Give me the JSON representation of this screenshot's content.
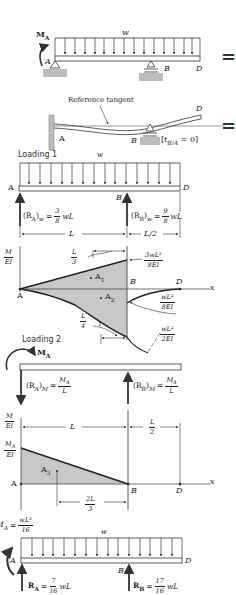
{
  "figure": {
    "panel_1_actual": {
      "moment_label": "M",
      "moment_sub": "A",
      "load_label": "w",
      "point_a": "A",
      "point_b": "B",
      "point_d": "D",
      "equals": "="
    },
    "panel_2_deflected": {
      "tangent_label": "Reference tangent",
      "point_a": "A",
      "point_b": "B",
      "point_d": "D",
      "condition": "[t",
      "condition_sub": "B/A",
      "condition_rhs": " = 0]",
      "equals": "="
    },
    "loading_1": {
      "title": "Loading 1",
      "load_label": "w",
      "point_a": "A",
      "point_b": "B",
      "point_d": "D",
      "reaction_a": {
        "prefix": "(R",
        "sub": "A",
        "suffix": ")",
        "subscript_w": "w",
        "eq": "=",
        "num": "3",
        "den": "8",
        "tail": "wL"
      },
      "reaction_b": {
        "prefix": "(R",
        "sub": "B",
        "suffix": ")",
        "subscript_w": "w",
        "eq": "=",
        "num": "9",
        "den": "8",
        "tail": "wL"
      },
      "dim_span": "L",
      "dim_overhang": "L/2",
      "diagram": {
        "axis_y_num": "M",
        "axis_y_den": "EI",
        "axis_x": "x",
        "point_a": "A",
        "point_b": "B",
        "point_d": "D",
        "area_1": "A",
        "area_1_sub": "1",
        "area_2": "A",
        "area_2_sub": "2",
        "centroid_1_num": "L",
        "centroid_1_den": "3",
        "centroid_2_num": "L",
        "centroid_2_den": "4",
        "peak_1_num": "3wL²",
        "peak_1_den": "8EI",
        "peak_2_num": "wL²",
        "peak_2_den": "8EI",
        "peak_3_num": "wL²",
        "peak_3_den": "2EI",
        "tick_1": "1"
      }
    },
    "loading_2": {
      "title": "Loading 2",
      "moment_label": "M",
      "moment_sub": "A",
      "reaction_a": {
        "prefix": "(R",
        "sub": "A",
        "suffix": ")",
        "subscript_m": "M",
        "eq": "=",
        "num": "M_A",
        "den": "L"
      },
      "reaction_b": {
        "prefix": "(R",
        "sub": "B",
        "suffix": ")",
        "subscript_m": "M",
        "eq": "=",
        "num": "M_A",
        "den": "L"
      },
      "diagram": {
        "axis_y_num": "M",
        "axis_y_den": "EI",
        "peak_num": "M_A",
        "peak_den": "EI",
        "axis_x": "x",
        "dim_span": "L",
        "dim_overhang_num": "L",
        "dim_overhang_den": "2",
        "point_a": "A",
        "point_b": "B",
        "point_d": "D",
        "area_3": "A",
        "area_3_sub": "3",
        "centroid_num": "2L",
        "centroid_den": "3"
      }
    },
    "result": {
      "moment_prefix": "M",
      "moment_sub": "A",
      "moment_eq": "=",
      "moment_num": "wL²",
      "moment_den": "16",
      "load_label": "w",
      "point_a": "A",
      "point_b": "B",
      "point_d": "D",
      "reaction_a": {
        "prefix": "R",
        "sub": "A",
        "eq": "=",
        "num": "7",
        "den": "16",
        "tail": "wL"
      },
      "reaction_b": {
        "prefix": "R",
        "sub": "B",
        "eq": "=",
        "num": "17",
        "den": "16",
        "tail": "wL"
      }
    },
    "colors": {
      "ink": "#222222",
      "fill_gray": "#c8c8c8",
      "support_gray": "#bdbdbd",
      "background": "#ffffff"
    }
  }
}
